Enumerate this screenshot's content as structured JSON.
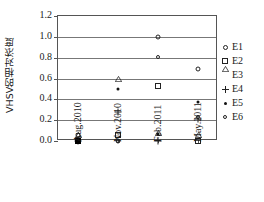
{
  "chart_data": {
    "type": "scatter",
    "title": "",
    "xlabel": "",
    "ylabel": "VHSV的相对浓度",
    "categories": [
      "Aug.2010",
      "Nov.2010",
      "Feb.2011",
      "May.2011"
    ],
    "ylim": [
      0.0,
      1.2
    ],
    "yticks": [
      "0.0",
      "0.2",
      "0.4",
      "0.6",
      "0.8",
      "1.0",
      "1.2"
    ],
    "ytick_values": [
      0.0,
      0.2,
      0.4,
      0.6,
      0.8,
      1.0,
      1.2
    ],
    "grid": true,
    "legend_position": "right",
    "series": [
      {
        "name": "E1",
        "marker": "open-circle",
        "points": [
          {
            "x": "Aug.2010",
            "y": 0.06
          },
          {
            "x": "Nov.2010",
            "y": 0.0
          },
          {
            "x": "Feb.2011",
            "y": 1.0
          },
          {
            "x": "May.2011",
            "y": 0.69
          }
        ]
      },
      {
        "name": "E2",
        "marker": "open-square",
        "points": [
          {
            "x": "Aug.2010",
            "y": 0.0
          },
          {
            "x": "Nov.2010",
            "y": 0.06
          },
          {
            "x": "Feb.2011",
            "y": 0.53
          },
          {
            "x": "May.2011",
            "y": 0.0
          }
        ]
      },
      {
        "name": "E3",
        "marker": "open-triangle",
        "points": [
          {
            "x": "Aug.2010",
            "y": 0.0
          },
          {
            "x": "Nov.2010",
            "y": 0.54
          },
          {
            "x": "Feb.2011",
            "y": 0.02
          },
          {
            "x": "May.2011",
            "y": 0.0
          }
        ]
      },
      {
        "name": "E4",
        "marker": "plus",
        "points": [
          {
            "x": "Aug.2010",
            "y": 0.0
          },
          {
            "x": "Nov.2010",
            "y": 0.28
          },
          {
            "x": "Feb.2011",
            "y": 0.0
          },
          {
            "x": "May.2011",
            "y": 0.21
          }
        ]
      },
      {
        "name": "E5",
        "marker": "filled-dot",
        "points": [
          {
            "x": "Aug.2010",
            "y": 0.0
          },
          {
            "x": "Nov.2010",
            "y": 0.5
          },
          {
            "x": "Feb.2011",
            "y": 0.07
          },
          {
            "x": "May.2011",
            "y": 0.37
          }
        ]
      },
      {
        "name": "E6",
        "marker": "open-circle-small",
        "points": [
          {
            "x": "Aug.2010",
            "y": 0.0
          },
          {
            "x": "Nov.2010",
            "y": 0.0
          },
          {
            "x": "Feb.2011",
            "y": 0.81
          },
          {
            "x": "May.2011",
            "y": 0.23
          }
        ]
      }
    ],
    "extra_markers": [
      {
        "series": "E2",
        "x": "Aug.2010",
        "y": 0.0,
        "marker": "filled-square"
      }
    ]
  },
  "legend": {
    "items": [
      {
        "label": "E1",
        "marker": "open-circle"
      },
      {
        "label": "E2",
        "marker": "open-square"
      },
      {
        "label": "E3",
        "marker": "open-triangle"
      },
      {
        "label": "E4",
        "marker": "plus"
      },
      {
        "label": "E5",
        "marker": "filled-dot"
      },
      {
        "label": "E6",
        "marker": "open-circle-small"
      }
    ]
  },
  "colors": {
    "axis": "#555555",
    "grid": "#777777",
    "marker": "#111111",
    "background": "#ffffff"
  }
}
